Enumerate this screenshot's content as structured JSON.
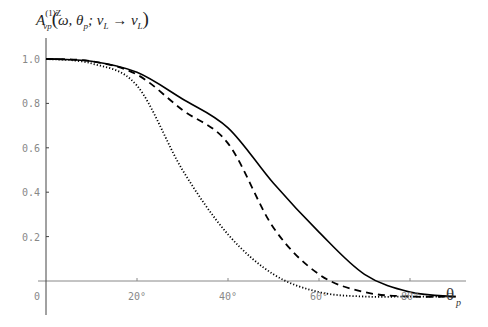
{
  "chart_data": {
    "type": "line",
    "xlabel": "θ_p",
    "ylabel": "",
    "xlim": [
      0,
      92
    ],
    "ylim": [
      -0.07,
      1.0
    ],
    "x_ticks": [
      20,
      40,
      60,
      80
    ],
    "x_tick_labels": [
      "20°",
      "40°",
      "60°",
      "80°"
    ],
    "y_ticks": [
      0.2,
      0.4,
      0.6,
      0.8,
      1.0
    ],
    "y_tick_labels": [
      "0.2",
      "0.4",
      "0.6",
      "0.8",
      "1.0"
    ],
    "origin_label": "0",
    "grid": false,
    "legend": null,
    "x": [
      0,
      10,
      20,
      30,
      40,
      50,
      60,
      70,
      80,
      90
    ],
    "series": [
      {
        "name": "solid",
        "style": "solid",
        "values": [
          1.0,
          0.99,
          0.94,
          0.82,
          0.69,
          0.44,
          0.22,
          0.03,
          -0.05,
          -0.07
        ]
      },
      {
        "name": "dashed",
        "style": "dashed",
        "values": [
          1.0,
          0.99,
          0.93,
          0.77,
          0.62,
          0.24,
          0.03,
          -0.05,
          -0.07,
          -0.07
        ]
      },
      {
        "name": "dotted",
        "style": "dotted",
        "values": [
          1.0,
          0.98,
          0.88,
          0.5,
          0.21,
          0.03,
          -0.05,
          -0.07,
          -0.07,
          -0.07
        ]
      }
    ]
  },
  "title": {
    "main": "A",
    "sup": "(1)Z",
    "sub": "vp",
    "args_open": "(",
    "omega": "ω, θ",
    "p": "p",
    "semi": "; ν",
    "L1": "L",
    "arrow": " → ν",
    "L2": "L",
    "args_close": ")"
  }
}
